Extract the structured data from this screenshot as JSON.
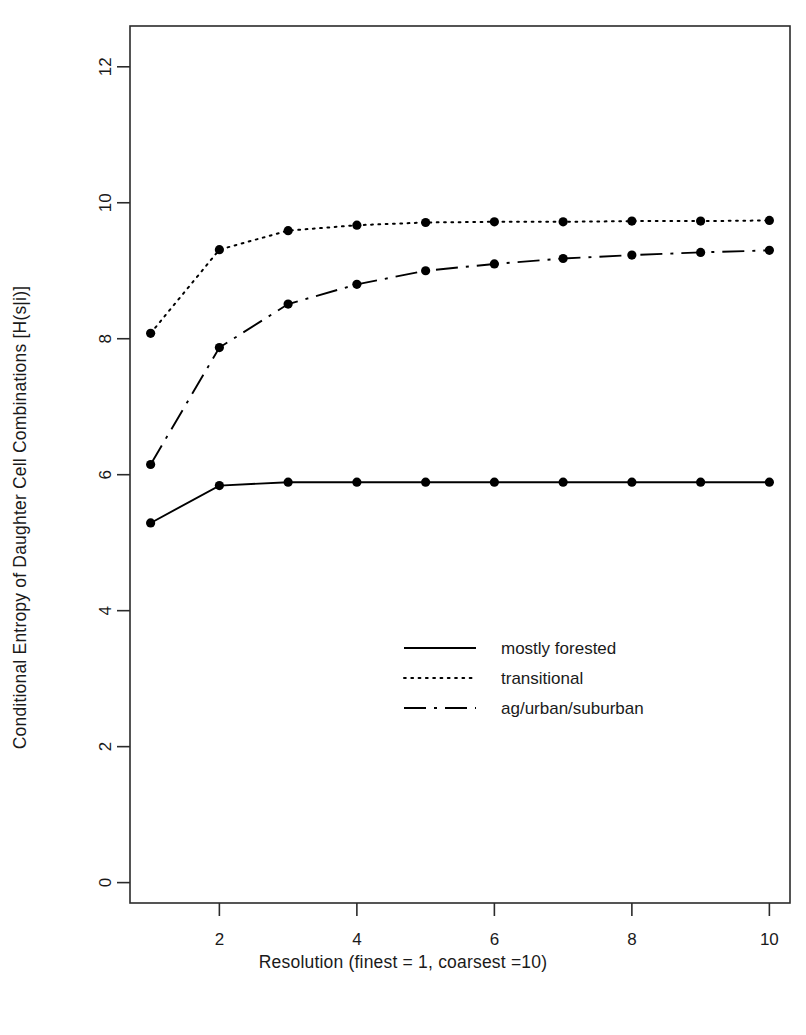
{
  "chart_data": {
    "type": "line",
    "title": "",
    "xlabel": "Resolution (finest = 1, coarsest =10)",
    "ylabel": "Conditional Entropy of Daughter Cell Combinations  [H(s|i)]",
    "x": [
      1,
      2,
      3,
      4,
      5,
      6,
      7,
      8,
      9,
      10
    ],
    "xlim": [
      0.7,
      10.3
    ],
    "ylim": [
      -0.3,
      12.6
    ],
    "xticks": [
      2,
      4,
      6,
      8,
      10
    ],
    "xticklabels": [
      "2",
      "4",
      "6",
      "8",
      "10"
    ],
    "yticks": [
      0,
      2,
      4,
      6,
      8,
      10,
      12
    ],
    "yticklabels": [
      "0",
      "2",
      "4",
      "6",
      "8",
      "10",
      "12"
    ],
    "grid": false,
    "legend_position": "center-right",
    "markers": "filled-circle",
    "series": [
      {
        "name": "mostly forested",
        "linestyle": "solid",
        "color": "#000000",
        "values": [
          5.29,
          5.84,
          5.89,
          5.89,
          5.89,
          5.89,
          5.89,
          5.89,
          5.89,
          5.89
        ]
      },
      {
        "name": "transitional",
        "linestyle": "dotted",
        "color": "#000000",
        "values": [
          8.08,
          9.31,
          9.59,
          9.67,
          9.71,
          9.72,
          9.72,
          9.73,
          9.73,
          9.74
        ]
      },
      {
        "name": "ag/urban/suburban",
        "linestyle": "dashdot",
        "color": "#000000",
        "values": [
          6.15,
          7.87,
          8.51,
          8.8,
          9.0,
          9.1,
          9.18,
          9.23,
          9.27,
          9.3
        ]
      }
    ]
  },
  "axes": {
    "xlabel": "Resolution (finest = 1, coarsest =10)",
    "ylabel": "Conditional Entropy of Daughter Cell Combinations  [H(s|i)]"
  },
  "legend": {
    "entries": [
      {
        "label": "mostly forested",
        "style": "solid"
      },
      {
        "label": "transitional",
        "style": "dotted"
      },
      {
        "label": "ag/urban/suburban",
        "style": "dashdot"
      }
    ]
  },
  "xticklabels": [
    "2",
    "4",
    "6",
    "8",
    "10"
  ],
  "yticklabels": [
    "0",
    "2",
    "4",
    "6",
    "8",
    "10",
    "12"
  ],
  "colors": {
    "foreground": "#1a1a1a",
    "background": "#ffffff",
    "line": "#000000"
  }
}
